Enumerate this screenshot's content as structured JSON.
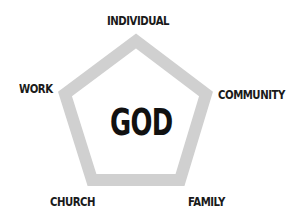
{
  "diagram": {
    "center": "GOD",
    "nodes": [
      {
        "id": "top",
        "label": "INDIVIDUAL"
      },
      {
        "id": "right",
        "label": "COMMUNITY"
      },
      {
        "id": "bottom-right",
        "label": "FAMILY"
      },
      {
        "id": "bottom-left",
        "label": "CHURCH"
      },
      {
        "id": "left",
        "label": "WORK"
      }
    ],
    "shape": "pentagon",
    "colors": {
      "outline": "#d0d0d0",
      "text": "#1a1a1a",
      "background": "#ffffff"
    }
  }
}
